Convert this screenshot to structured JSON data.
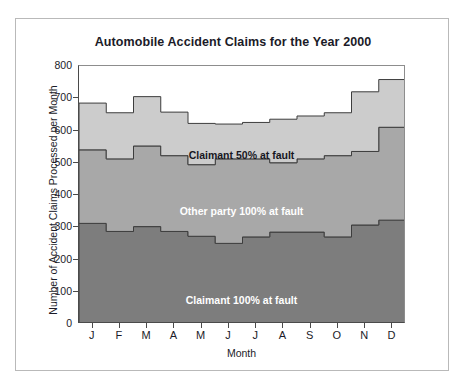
{
  "chart_data": {
    "type": "area",
    "title": "Automobile Accident Claims for the Year 2000",
    "xlabel": "Month",
    "ylabel": "Number of Accident Claims Processed per Month",
    "categories": [
      "J",
      "F",
      "M",
      "A",
      "M",
      "J",
      "J",
      "A",
      "S",
      "O",
      "N",
      "D"
    ],
    "category_names": [
      "January",
      "February",
      "March",
      "April",
      "May",
      "June",
      "July",
      "August",
      "September",
      "October",
      "November",
      "December"
    ],
    "stacked": true,
    "step": true,
    "grid": false,
    "legend_position": "inside-bands",
    "ylim": [
      0,
      800
    ],
    "xlim": [
      0,
      12
    ],
    "yticks": [
      0,
      100,
      200,
      300,
      400,
      500,
      600,
      700,
      800
    ],
    "ytick_labels": [
      "0",
      "100",
      "200",
      "300",
      "400",
      "500",
      "600",
      "700",
      "800"
    ],
    "series": [
      {
        "name": "Claimant 100% at fault",
        "color": "#7d7d7d",
        "label_color": "#ffffff",
        "values": [
          312,
          287,
          302,
          287,
          272,
          250,
          270,
          285,
          285,
          270,
          307,
          322
        ]
      },
      {
        "name": "Other party 100% at fault",
        "color": "#a8a8a8",
        "label_color": "#ffffff",
        "values": [
          228,
          225,
          250,
          235,
          222,
          262,
          242,
          215,
          227,
          252,
          228,
          288
        ]
      },
      {
        "name": "Claimant 50% at fault",
        "color": "#cccccc",
        "label_color": "#17171f",
        "values": [
          145,
          143,
          153,
          135,
          128,
          108,
          113,
          135,
          133,
          133,
          185,
          148
        ]
      }
    ],
    "cumulative_totals": [
      685,
      655,
      705,
      657,
      622,
      620,
      625,
      635,
      645,
      655,
      720,
      758
    ],
    "band_boundaries": {
      "lower_top": [
        312,
        287,
        302,
        287,
        272,
        250,
        270,
        285,
        285,
        270,
        307,
        322
      ],
      "middle_top": [
        540,
        512,
        552,
        522,
        494,
        512,
        512,
        500,
        512,
        522,
        535,
        610
      ],
      "upper_top": [
        685,
        655,
        705,
        657,
        622,
        620,
        625,
        635,
        645,
        655,
        720,
        758
      ]
    }
  },
  "figure": {
    "border_color": "#b9b9b9",
    "background": "#ffffff",
    "axis_color": "#4a4a4a"
  }
}
